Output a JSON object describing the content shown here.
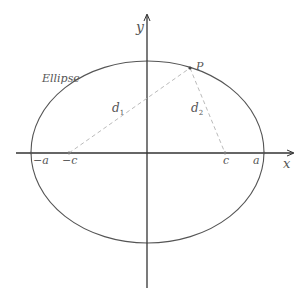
{
  "diagram": {
    "colors": {
      "curve": "#555555",
      "axis": "#333333",
      "dashed": "#bbbbbb",
      "text": "#555555"
    },
    "axes": {
      "x_label": "x",
      "y_label": "y"
    },
    "curve_label": "Ellipse",
    "point_label": "P",
    "ticks": {
      "neg_a": "−a",
      "neg_c": "−c",
      "pos_c": "c",
      "pos_a": "a"
    },
    "distances": {
      "d1": {
        "base": "d",
        "sub": "1"
      },
      "d2": {
        "base": "d",
        "sub": "2"
      }
    }
  }
}
